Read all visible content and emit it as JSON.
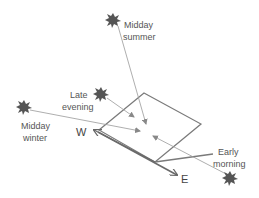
{
  "diagram": {
    "type": "solar-panel-sun-angles",
    "colors": {
      "panel": "#7a7a7a",
      "ray": "#999999",
      "sun": "#555555",
      "text": "#555555",
      "axis": "#6a6a6a"
    },
    "directions": {
      "west": "W",
      "east": "E"
    },
    "suns": [
      {
        "id": "midday-summer",
        "label_line1": "Midday",
        "label_line2": "summer"
      },
      {
        "id": "late-evening",
        "label_line1": "Late",
        "label_line2": "evening"
      },
      {
        "id": "midday-winter",
        "label_line1": "Midday",
        "label_line2": "winter"
      },
      {
        "id": "early-morning",
        "label_line1": "Early",
        "label_line2": "morning"
      }
    ]
  }
}
